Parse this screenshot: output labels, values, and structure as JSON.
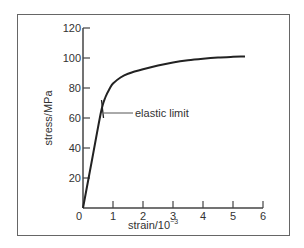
{
  "chart_data": {
    "type": "line",
    "title": "",
    "xlabel": "strain/10",
    "xlabel_exponent": "−3",
    "ylabel": "stress/MPa",
    "xlim": [
      0,
      6
    ],
    "ylim": [
      0,
      120
    ],
    "x_ticks": [
      "0",
      "1",
      "2",
      "3",
      "4",
      "5",
      "6"
    ],
    "y_ticks": [
      "20",
      "40",
      "60",
      "80",
      "100",
      "120"
    ],
    "grid": false,
    "legend": null,
    "series": [
      {
        "name": "stress-strain curve",
        "x": [
          0,
          0.3,
          0.6,
          0.75,
          0.9,
          1.0,
          1.25,
          1.5,
          2.0,
          2.5,
          3.0,
          3.5,
          4.0,
          4.5,
          5.0,
          5.4
        ],
        "y": [
          0,
          32,
          64,
          74,
          80,
          83,
          87,
          89.5,
          92.5,
          95,
          97,
          98.5,
          99.5,
          100.3,
          100.8,
          101
        ]
      }
    ],
    "annotations": [
      {
        "text": "elastic limit",
        "x": 0.65,
        "y": 64
      }
    ]
  },
  "colors": {
    "curve": "#222222",
    "axis": "#444444",
    "frame": "#666666"
  }
}
